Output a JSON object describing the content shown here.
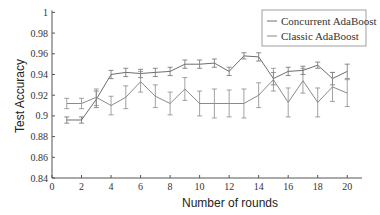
{
  "chart_data": {
    "type": "line",
    "title": "",
    "xlabel": "Number of rounds",
    "ylabel": "Test Accuracy",
    "xlim": [
      0,
      21
    ],
    "ylim": [
      0.84,
      1.0
    ],
    "xticks": [
      0,
      2,
      4,
      6,
      8,
      10,
      12,
      14,
      16,
      18,
      20
    ],
    "yticks": [
      0.84,
      0.86,
      0.88,
      0.9,
      0.92,
      0.94,
      0.96,
      0.98,
      1
    ],
    "ytick_labels": [
      "0.84",
      "0.86",
      "0.88",
      "0.9",
      "0.92",
      "0.94",
      "0.96",
      "0.98",
      "1"
    ],
    "grid": false,
    "legend_position": "upper right",
    "error_bars": true,
    "x": [
      1,
      2,
      3,
      4,
      5,
      6,
      7,
      8,
      9,
      10,
      11,
      12,
      13,
      14,
      15,
      16,
      17,
      18,
      19,
      20
    ],
    "series": [
      {
        "name": "Concurrent AdaBoost",
        "color": "#6e6e6e",
        "values": [
          0.896,
          0.896,
          0.916,
          0.94,
          0.942,
          0.941,
          0.942,
          0.943,
          0.95,
          0.95,
          0.951,
          0.943,
          0.958,
          0.957,
          0.936,
          0.943,
          0.944,
          0.949,
          0.936,
          0.943
        ],
        "errors": [
          0.003,
          0.003,
          0.008,
          0.004,
          0.004,
          0.004,
          0.004,
          0.004,
          0.004,
          0.004,
          0.004,
          0.004,
          0.003,
          0.004,
          0.006,
          0.004,
          0.004,
          0.003,
          0.006,
          0.007
        ]
      },
      {
        "name": "Classic AdaBoost",
        "color": "#8a8a8a",
        "values": [
          0.912,
          0.912,
          0.918,
          0.91,
          0.918,
          0.933,
          0.919,
          0.912,
          0.926,
          0.912,
          0.912,
          0.912,
          0.912,
          0.92,
          0.935,
          0.913,
          0.934,
          0.913,
          0.928,
          0.922
        ],
        "errors": [
          0.005,
          0.005,
          0.008,
          0.009,
          0.011,
          0.01,
          0.011,
          0.011,
          0.011,
          0.012,
          0.014,
          0.013,
          0.014,
          0.012,
          0.011,
          0.014,
          0.012,
          0.014,
          0.014,
          0.013
        ]
      }
    ]
  }
}
